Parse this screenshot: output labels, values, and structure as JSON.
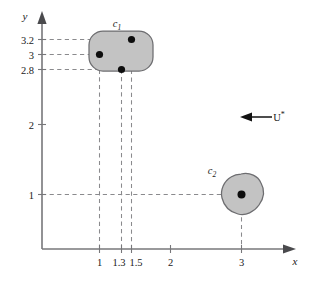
{
  "figure": {
    "title": "",
    "background_color": "#ffffff",
    "axis_color": "#77777a",
    "dashed_color": "#8a8a8d",
    "blob_fill": "#c3c3c3",
    "blob_stroke": "#6d6d70",
    "dot_color": "#0d0d0d"
  },
  "axes": {
    "x_label": "x",
    "y_label": "y",
    "x_ticks": [
      {
        "label": "1",
        "value": 1
      },
      {
        "label": "1.3",
        "value": 1.3
      },
      {
        "label": "1.5",
        "value": 1.5
      },
      {
        "label": "2",
        "value": 2
      },
      {
        "label": "3",
        "value": 3
      }
    ],
    "y_ticks": [
      {
        "label": "3.2",
        "value": 3.2
      },
      {
        "label": "3",
        "value": 3
      },
      {
        "label": "2.8",
        "value": 2.8
      },
      {
        "label": "2",
        "value": 2
      },
      {
        "label": "1",
        "value": 1
      }
    ],
    "x_range": [
      0,
      3.45
    ],
    "y_range": [
      0,
      3.6
    ]
  },
  "shapes": [
    {
      "name": "c1",
      "label": "c",
      "label_sub": "1",
      "type": "rounded-rectangle",
      "label_position": "top"
    },
    {
      "name": "c2",
      "label": "c",
      "label_sub": "2",
      "type": "blob",
      "label_position": "top-left"
    }
  ],
  "points": [
    {
      "shape": "c1",
      "x": 1.5,
      "y": 3.2
    },
    {
      "shape": "c1",
      "x": 1.0,
      "y": 3.0
    },
    {
      "shape": "c1",
      "x": 1.3,
      "y": 2.8
    },
    {
      "shape": "c2",
      "x": 3.0,
      "y": 1.0
    }
  ],
  "annotation": {
    "flow_label": "U",
    "flow_label_sup": "*",
    "arrow_direction": "left"
  }
}
